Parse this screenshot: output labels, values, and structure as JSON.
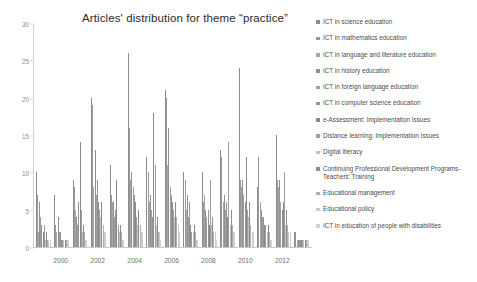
{
  "chart_data": {
    "type": "bar",
    "title": "Articles' distribution for theme “practice”",
    "xlabel": "",
    "ylabel": "",
    "ylim": [
      0,
      30
    ],
    "yticks": [
      0,
      5,
      10,
      15,
      20,
      25,
      30
    ],
    "grid": false,
    "legend_position": "right",
    "categories": [
      "1999",
      "2000",
      "2001",
      "2002",
      "2003",
      "2004",
      "2005",
      "2006",
      "2007",
      "2008",
      "2009",
      "2010",
      "2011",
      "2012",
      "2013"
    ],
    "xtick_labels": [
      "2000",
      "2002",
      "2004",
      "2006",
      "2008",
      "2010",
      "2012"
    ],
    "series": [
      {
        "name": "ICT in science education",
        "color": "#8c8c8c",
        "values": [
          10,
          7,
          9,
          20,
          11,
          26,
          12,
          21,
          10,
          10,
          13,
          24,
          8,
          15,
          2
        ]
      },
      {
        "name": "ICT in mathematics education",
        "color": "#9a9a9a",
        "values": [
          7,
          3,
          8,
          19,
          7,
          16,
          10,
          20,
          9,
          6,
          12,
          9,
          12,
          9,
          2
        ]
      },
      {
        "name": "ICT in language and literature education",
        "color": "#a6a6a6",
        "values": [
          2,
          2,
          5,
          8,
          6,
          9,
          6,
          11,
          5,
          7,
          6,
          8,
          6,
          8,
          1
        ]
      },
      {
        "name": "ICT in history education",
        "color": "#8f8f8f",
        "values": [
          6,
          4,
          4,
          13,
          6,
          10,
          7,
          16,
          7,
          5,
          7,
          9,
          5,
          9,
          1
        ]
      },
      {
        "name": "ICT in foreign language education",
        "color": "#a0a0a0",
        "values": [
          4,
          2,
          3,
          7,
          4,
          8,
          5,
          8,
          4,
          4,
          5,
          7,
          4,
          6,
          1
        ]
      },
      {
        "name": "ICT in computer science education",
        "color": "#949494",
        "values": [
          3,
          2,
          6,
          9,
          5,
          7,
          4,
          7,
          6,
          5,
          6,
          6,
          4,
          5,
          1
        ]
      },
      {
        "name": "e-Assessment: Implementation Issues",
        "color": "#8a8a8a",
        "values": [
          2,
          1,
          14,
          6,
          9,
          6,
          18,
          6,
          3,
          3,
          4,
          12,
          3,
          6,
          1
        ]
      },
      {
        "name": "Distance learning: Implementation Issues",
        "color": "#9d9d9d",
        "values": [
          3,
          1,
          5,
          5,
          3,
          4,
          11,
          5,
          2,
          9,
          14,
          5,
          3,
          10,
          1
        ]
      },
      {
        "name": "Digital literacy",
        "color": "#c2c2c2",
        "values": [
          1,
          1,
          2,
          4,
          2,
          3,
          3,
          4,
          2,
          3,
          3,
          4,
          2,
          3,
          1
        ]
      },
      {
        "name": "Continuing Professional Development Programs-Teachers' Training",
        "color": "#8d8d8d",
        "values": [
          2,
          1,
          3,
          6,
          3,
          5,
          4,
          6,
          3,
          4,
          5,
          6,
          3,
          5,
          1
        ]
      },
      {
        "name": "Educational management",
        "color": "#b0b0b0",
        "values": [
          1,
          1,
          2,
          3,
          2,
          3,
          2,
          4,
          2,
          2,
          3,
          3,
          2,
          3,
          1
        ]
      },
      {
        "name": "Educational policy",
        "color": "#cbcbcb",
        "values": [
          1,
          1,
          1,
          2,
          1,
          2,
          2,
          3,
          1,
          2,
          2,
          2,
          1,
          2,
          1
        ]
      },
      {
        "name": "ICT in education of people with disabilities",
        "color": "#d2d2d2",
        "values": [
          1,
          1,
          1,
          2,
          1,
          2,
          1,
          2,
          1,
          1,
          2,
          2,
          1,
          2,
          1
        ]
      }
    ]
  }
}
